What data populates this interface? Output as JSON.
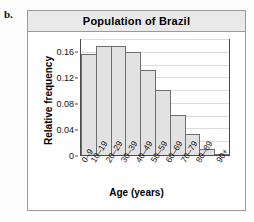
{
  "part_label": "b.",
  "header": {
    "title": "Population of Brazil"
  },
  "axes": {
    "ylabel": "Relative frequency",
    "xlabel": "Age (years)",
    "yticks": [
      "0.16",
      "0.12",
      "0.08",
      "0.04",
      "0"
    ]
  },
  "colors": {
    "bar_fill": "#e2e2e2",
    "bar_edge": "#6e6e6e",
    "header_bg": "#e9e9e9",
    "grid": "#dcdcdc",
    "frame": "#4a4a4a"
  },
  "chart_data": {
    "type": "bar",
    "title": "Population of Brazil",
    "xlabel": "Age (years)",
    "ylabel": "Relative frequency",
    "categories": [
      "0–9",
      "10–19",
      "20–29",
      "30–39",
      "40–49",
      "50–59",
      "60–69",
      "70–79",
      "80–89",
      "90+"
    ],
    "values": [
      0.158,
      0.171,
      0.171,
      0.161,
      0.133,
      0.102,
      0.063,
      0.033,
      0.009,
      0.001
    ],
    "ylim": [
      0,
      0.18
    ],
    "ytick_values": [
      0,
      0.04,
      0.08,
      0.12,
      0.16
    ],
    "minor_gridline_step": 0.02,
    "grid": true,
    "legend": "none"
  }
}
